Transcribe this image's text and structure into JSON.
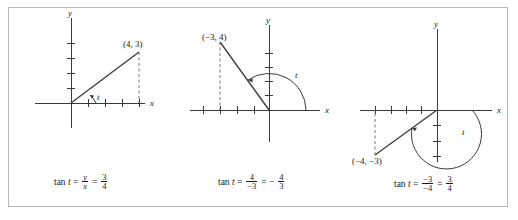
{
  "figure": {
    "border_color": "#b9b9bd",
    "background": "#ffffff",
    "ink_color": "#3a3a3a",
    "text_color": "#1a1a1a"
  },
  "panels": [
    {
      "id": "panel-1",
      "quadrant": "I",
      "point_label": "(4, 3)",
      "point": {
        "x": 4,
        "y": 3
      },
      "angle_label": "t",
      "x_axis_label": "x",
      "y_axis_label": "y",
      "x_ticks": [
        1,
        2,
        3,
        4
      ],
      "y_ticks": [
        1,
        2,
        3,
        4
      ],
      "formula": {
        "lhs": "tan",
        "variable": "t",
        "eq1": "=",
        "frac1_num": "y",
        "frac1_den": "x",
        "eq2": "=",
        "frac2_num": "3",
        "frac2_den": "4",
        "plain": "tan t = y/x = 3/4"
      }
    },
    {
      "id": "panel-2",
      "quadrant": "II",
      "point_label": "(−3, 4)",
      "point": {
        "x": -3,
        "y": 4
      },
      "angle_label": "t",
      "x_axis_label": "x",
      "y_axis_label": "y",
      "x_ticks": [
        -4,
        -3,
        -2,
        -1
      ],
      "y_ticks": [
        1,
        2,
        3,
        4
      ],
      "formula": {
        "lhs": "tan",
        "variable": "t",
        "eq1": "=",
        "frac1_num": "4",
        "frac1_den": "−3",
        "eq2": "=",
        "sign": "−",
        "frac2_num": "4",
        "frac2_den": "3",
        "plain": "tan t = 4/−3 = − 4/3"
      }
    },
    {
      "id": "panel-3",
      "quadrant": "III",
      "point_label": "(−4, −3)",
      "point": {
        "x": -4,
        "y": -3
      },
      "angle_label": "t",
      "x_axis_label": "x",
      "y_axis_label": "y",
      "x_ticks": [
        -4,
        -3,
        -2,
        -1
      ],
      "y_ticks": [
        -1,
        -2,
        -3
      ],
      "formula": {
        "lhs": "tan",
        "variable": "t",
        "eq1": "=",
        "frac1_num": "−3",
        "frac1_den": "−4",
        "eq2": "=",
        "frac2_num": "3",
        "frac2_den": "4",
        "plain": "tan t = −3/−4 = 3/4"
      }
    }
  ]
}
